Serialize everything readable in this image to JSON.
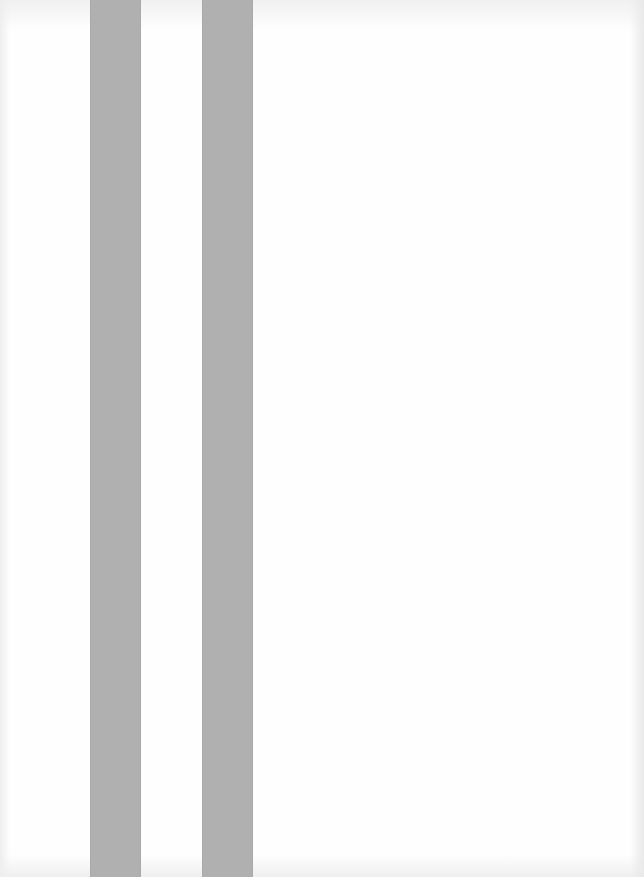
{
  "page": {
    "background_color": "#fefefe",
    "stripes": [
      {
        "name": "stripe-1",
        "color": "#b0b0b0"
      },
      {
        "name": "stripe-2",
        "color": "#b0b0b0"
      }
    ]
  }
}
